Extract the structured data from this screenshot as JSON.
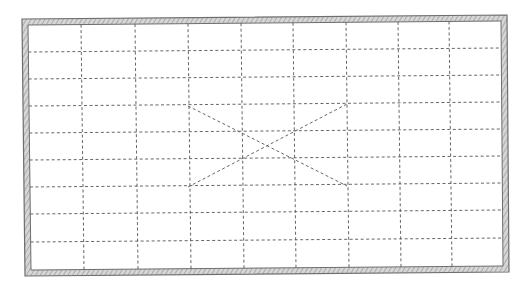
{
  "diagram": {
    "type": "framed-grid-plan",
    "canvas": {
      "width": 532,
      "height": 291,
      "background": "#ffffff"
    },
    "frame": {
      "outer_corners": [
        [
          22,
          19
        ],
        [
          507,
          15
        ],
        [
          509,
          272
        ],
        [
          25,
          276
        ]
      ],
      "thickness": 6,
      "line_color": "#6e6e6e",
      "hatch_color": "#a8a8a8",
      "fill_color": "#d4d4d4"
    },
    "grid": {
      "columns": 9,
      "rows": 9,
      "inner_left": 28,
      "inner_top": 23,
      "inner_right": 502,
      "inner_bottom": 269,
      "x_lines": [
        81,
        135,
        188,
        241,
        293,
        346,
        398,
        449
      ],
      "y_lines": [
        52,
        79,
        106,
        133,
        160,
        187,
        214,
        242
      ],
      "line_color": "#555555",
      "dash": "3,2.5"
    },
    "cross_mark": {
      "description": "dashed X spanning 3 columns x 3 rows",
      "lines": [
        {
          "from": [
            188,
            106
          ],
          "to": [
            347,
            186
          ]
        },
        {
          "from": [
            188,
            187
          ],
          "to": [
            347,
            104
          ]
        }
      ],
      "line_color": "#555555"
    },
    "rotation_deg": -0.45,
    "labels": []
  }
}
